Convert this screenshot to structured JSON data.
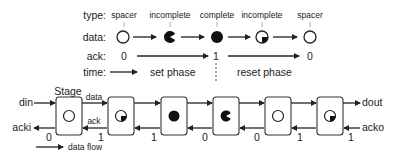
{
  "legend_rows": {
    "type_label": "type:",
    "data_label": "data:",
    "ack_label": "ack:",
    "time_label": "time:"
  },
  "sequence": [
    {
      "type": "spacer",
      "data_icon": "empty-circle-icon"
    },
    {
      "type": "incomplete",
      "data_icon": "pacman-icon"
    },
    {
      "type": "complete",
      "data_icon": "filled-circle-icon"
    },
    {
      "type": "incomplete",
      "data_icon": "partial-circle-icon"
    },
    {
      "type": "spacer",
      "data_icon": "empty-circle-icon"
    }
  ],
  "ack_values": [
    "0",
    "1",
    "0"
  ],
  "phases": {
    "set": "set phase",
    "reset": "reset phase"
  },
  "pipeline": {
    "stage_label": "Stage",
    "input_data": "din",
    "input_ack": "acki",
    "output_data": "dout",
    "output_ack": "acko",
    "data_wire_label": "data",
    "ack_wire_label": "ack",
    "stages": [
      {
        "state": "spacer",
        "icon": "empty-circle-icon"
      },
      {
        "state": "incomplete",
        "icon": "partial-circle-icon"
      },
      {
        "state": "complete",
        "icon": "filled-circle-icon"
      },
      {
        "state": "incomplete",
        "icon": "pacman-icon"
      },
      {
        "state": "spacer",
        "icon": "empty-circle-icon"
      },
      {
        "state": "incomplete",
        "icon": "partial-circle-icon"
      }
    ],
    "ack_numbers": [
      "0",
      "1",
      "1",
      "0",
      "0",
      "1",
      "1"
    ]
  },
  "flow_legend": {
    "label": "data flow"
  }
}
